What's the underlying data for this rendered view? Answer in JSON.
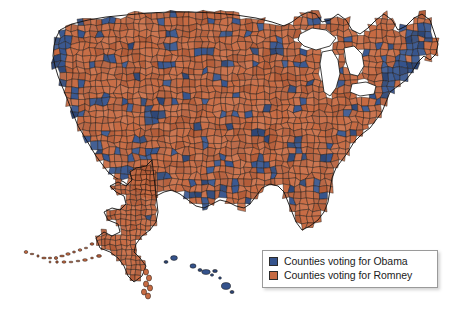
{
  "figure": {
    "type": "choropleth-map",
    "background_color": "#ffffff"
  },
  "colors": {
    "obama_blue": "#35538c",
    "obama_blue_dark": "#2b4474",
    "romney_orange": "#c66a42",
    "romney_orange_dark": "#b35c38",
    "county_border": "#1a1410",
    "legend_border": "#9a9a9a",
    "legend_background": "#ffffff",
    "legend_text": "#1b1b1b"
  },
  "legend": {
    "position": "bottom-right",
    "items": [
      {
        "swatch_color": "#35538c",
        "label": "Counties voting for Obama",
        "candidate": "Obama"
      },
      {
        "swatch_color": "#c66a42",
        "label": "Counties voting for Romney",
        "candidate": "Romney"
      }
    ]
  },
  "chart_data": {
    "type": "map",
    "title": "",
    "categories": [
      "Counties voting for Obama",
      "Counties voting for Romney"
    ],
    "series": [
      {
        "name": "Counties voting for Obama",
        "color": "#35538c"
      },
      {
        "name": "Counties voting for Romney",
        "color": "#c66a42"
      }
    ],
    "regions": [
      {
        "name": "Alaska",
        "winner": "Romney",
        "color": "#c66a42"
      },
      {
        "name": "Hawaii",
        "winner": "Obama",
        "color": "#35538c"
      },
      {
        "name": "Pacific Coast",
        "winner": "Obama",
        "color": "#35538c"
      },
      {
        "name": "Great Plains",
        "winner": "Romney",
        "color": "#c66a42"
      },
      {
        "name": "Northeast",
        "winner": "Obama",
        "color": "#35538c"
      },
      {
        "name": "Southeast",
        "winner": "Romney",
        "color": "#c66a42"
      },
      {
        "name": "Mountain West",
        "winner": "Romney",
        "color": "#c66a42"
      }
    ],
    "legend_position": "bottom-right",
    "grid": false
  }
}
